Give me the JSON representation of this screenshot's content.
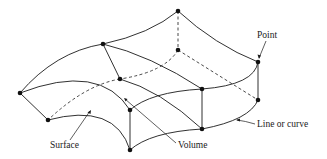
{
  "diagram": {
    "type": "3d-geometry-entity-illustration",
    "stroke_color": "#1a1a1a",
    "background": "#ffffff",
    "points": [
      {
        "id": "top",
        "x": 178,
        "y": 11
      },
      {
        "id": "upper-mid",
        "x": 103,
        "y": 44
      },
      {
        "id": "left",
        "x": 20,
        "y": 93
      },
      {
        "id": "hidden-back",
        "x": 178,
        "y": 50
      },
      {
        "id": "inner-mid",
        "x": 120,
        "y": 79
      },
      {
        "id": "right-top",
        "x": 258,
        "y": 62
      },
      {
        "id": "right-bottom",
        "x": 258,
        "y": 100
      },
      {
        "id": "center-top",
        "x": 202,
        "y": 89
      },
      {
        "id": "center-bottom",
        "x": 202,
        "y": 129
      },
      {
        "id": "front-top",
        "x": 130,
        "y": 110
      },
      {
        "id": "front-bottom",
        "x": 130,
        "y": 150
      },
      {
        "id": "lower-left",
        "x": 48,
        "y": 120
      }
    ],
    "labels": {
      "point": "Point",
      "line_or_curve": "Line or curve",
      "surface": "Surface",
      "volume": "Volume"
    }
  }
}
